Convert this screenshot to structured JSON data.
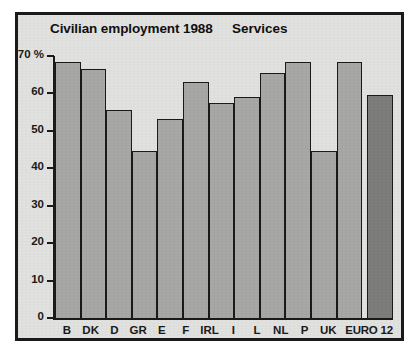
{
  "chart_data": {
    "type": "bar",
    "title": "Civilian employment 1988",
    "subtitle": "Services",
    "xlabel": "",
    "ylabel": "",
    "yunit": "%",
    "ylim": [
      0,
      70
    ],
    "yticks": [
      0,
      10,
      20,
      30,
      40,
      50,
      60,
      70
    ],
    "ytick_labels": [
      "0",
      "10",
      "20",
      "30",
      "40",
      "50",
      "60",
      "70 %"
    ],
    "grid": false,
    "legend": null,
    "categories": [
      "B",
      "DK",
      "D",
      "GR",
      "E",
      "F",
      "IRL",
      "I",
      "L",
      "NL",
      "P",
      "UK",
      "EURO 12"
    ],
    "values": [
      68.5,
      66.5,
      55.5,
      44.7,
      53.3,
      63.0,
      57.5,
      59.0,
      65.5,
      68.5,
      44.5,
      68.5,
      59.5
    ],
    "highlight_index": 12,
    "bar_color": "#a9a9a7",
    "highlight_color": "#7e7e7c",
    "outline_color": "#1a1a1a",
    "background_color": "#e3e3e1"
  }
}
